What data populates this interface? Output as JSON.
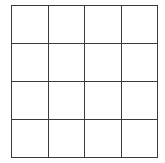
{
  "grid": {
    "rows": 4,
    "columns": 4,
    "line_color": "#3a3a3a",
    "background": "#ffffff",
    "cells": [
      [
        "",
        "",
        "",
        ""
      ],
      [
        "",
        "",
        "",
        ""
      ],
      [
        "",
        "",
        "",
        ""
      ],
      [
        "",
        "",
        "",
        ""
      ]
    ]
  }
}
